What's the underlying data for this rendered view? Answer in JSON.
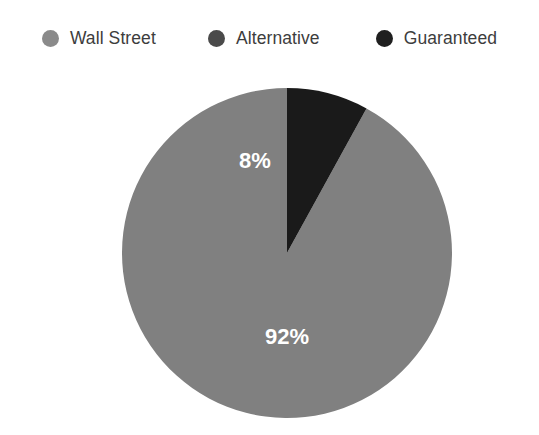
{
  "chart_data": {
    "type": "pie",
    "title": "",
    "subtitle": "",
    "xlabel": "",
    "ylabel": "",
    "legend_position": "top",
    "grid": false,
    "categories": [
      "Wall Street",
      "Alternative",
      "Guaranteed"
    ],
    "values": [
      92,
      0,
      8
    ],
    "value_labels": [
      "92%",
      "",
      "8%"
    ],
    "unit": "%",
    "start_angle_deg": 0,
    "direction": "counterclockwise",
    "colors": [
      "#808080",
      "#4a4a4a",
      "#1a1a1a"
    ],
    "slices": [
      {
        "name": "Wall Street",
        "value": 92,
        "label": "92%",
        "color": "#808080",
        "label_color": "#ffffff",
        "label_visible": true
      },
      {
        "name": "Alternative",
        "value": 0,
        "label": "",
        "color": "#4a4a4a",
        "label_color": "#ffffff",
        "label_visible": false
      },
      {
        "name": "Guaranteed",
        "value": 8,
        "label": "8%",
        "color": "#1a1a1a",
        "label_color": "#ffffff",
        "label_visible": true
      }
    ]
  },
  "legend": {
    "items": [
      {
        "label": "Wall Street",
        "color": "#8a8a8a",
        "marker": "circle-icon"
      },
      {
        "label": "Alternative",
        "color": "#4a4a4a",
        "marker": "circle-icon"
      },
      {
        "label": "Guaranteed",
        "color": "#1f1f1f",
        "marker": "circle-icon"
      }
    ]
  },
  "pie_geometry": {
    "center_x": 165,
    "center_y": 165,
    "radius": 165,
    "label_92_x": 165,
    "label_92_y": 250,
    "label_8_x": 133,
    "label_8_y": 74
  },
  "colors": {
    "background": "#ffffff",
    "legend_text": "#3d3d3d",
    "slice_label": "#ffffff"
  }
}
